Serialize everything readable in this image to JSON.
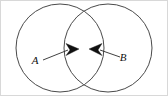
{
  "figure": {
    "width": 168,
    "height": 96,
    "background_color": "#ffffff",
    "border_color": "#d8d8d8",
    "outline_color": "#4a4a4a",
    "arrow_color": "#111111",
    "label_color": "#101010"
  },
  "shapes": {
    "left_circle": {
      "name": "left-circle",
      "center_x": 60,
      "center_y": 48,
      "radius": 44
    },
    "right_circle": {
      "name": "right-circle",
      "center_x": 108,
      "center_y": 48,
      "radius": 44
    },
    "intersection": {
      "name": "lens-region",
      "top_crossing_x": 84,
      "top_crossing_y": 24,
      "bottom_crossing_x": 84,
      "bottom_crossing_y": 73
    }
  },
  "annotations": [
    {
      "id": "a",
      "label": "A",
      "label_x": 35,
      "label_y": 64,
      "leader_start_x": 43,
      "leader_start_y": 60,
      "leader_end_x": 68,
      "leader_end_y": 50,
      "arrow_tip_x": 79,
      "arrow_tip_y": 49,
      "arrow_direction": "right"
    },
    {
      "id": "b",
      "label": "B",
      "label_x": 123,
      "label_y": 61,
      "leader_start_x": 120,
      "leader_start_y": 57,
      "leader_end_x": 100,
      "leader_end_y": 50,
      "arrow_tip_x": 89,
      "arrow_tip_y": 49,
      "arrow_direction": "left"
    }
  ]
}
